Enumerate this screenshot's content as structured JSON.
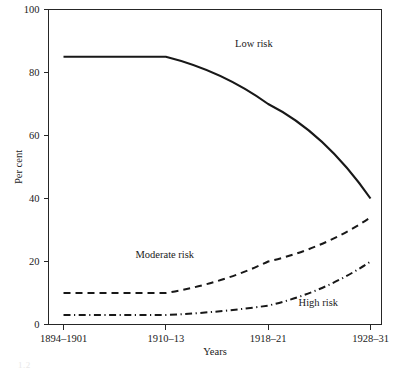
{
  "chart_data": {
    "type": "line",
    "title": "",
    "xlabel": "Years",
    "ylabel": "Per cent",
    "categories": [
      "1894–1901",
      "1910–13",
      "1918–21",
      "1928–31"
    ],
    "ylim": [
      0,
      100
    ],
    "yticks": [
      0,
      20,
      40,
      60,
      80,
      100
    ],
    "ytick_labels": [
      "0",
      "20",
      "40",
      "60",
      "80",
      "100"
    ],
    "grid": false,
    "legend_position": "inline-annotations",
    "series": [
      {
        "name": "Low risk",
        "style": "solid",
        "color": "#181818",
        "values": [
          85,
          85,
          70,
          40
        ],
        "label_x_category_fraction": 0.62,
        "label_value": 88
      },
      {
        "name": "Moderate risk",
        "style": "dashed",
        "color": "#181818",
        "values": [
          10,
          10,
          20,
          34
        ],
        "label_x_category_fraction": 0.33,
        "label_value": 21
      },
      {
        "name": "High risk",
        "style": "dash-dot",
        "color": "#181818",
        "values": [
          3,
          3,
          6,
          20
        ],
        "label_x_category_fraction": 0.83,
        "label_value": 6
      }
    ],
    "annotations": [
      {
        "text": "Low risk",
        "series": "Low risk"
      },
      {
        "text": "Moderate risk",
        "series": "Moderate risk"
      },
      {
        "text": "High risk",
        "series": "High risk"
      }
    ]
  },
  "figure": {
    "background_color": "#ffffff",
    "ink_color": "#1a1a1a",
    "frame_color": "#262626",
    "caption_fragment": "1.2"
  }
}
